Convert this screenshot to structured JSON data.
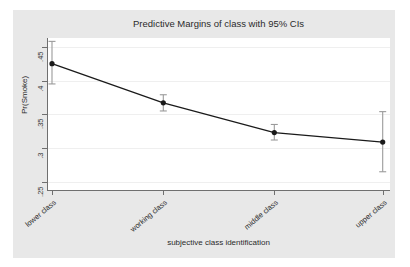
{
  "chart_data": {
    "type": "line",
    "title": "Predictive Margins of class with 95% CIs",
    "xlabel": "subjective class identification",
    "ylabel": "Pr(Smoke)",
    "categories": [
      "lower class",
      "working class",
      "middle class",
      "upper class"
    ],
    "values": [
      0.425,
      0.367,
      0.323,
      0.309
    ],
    "error_bars": {
      "lower": [
        0.395,
        0.355,
        0.312,
        0.265
      ],
      "upper": [
        0.458,
        0.379,
        0.335,
        0.354
      ]
    },
    "ylim": [
      0.238,
      0.463
    ],
    "yticks": [
      0.25,
      0.3,
      0.35,
      0.4,
      0.45
    ],
    "ytick_labels": [
      ".25",
      ".3",
      ".35",
      ".4",
      ".45"
    ],
    "grid": true,
    "legend": "none",
    "marker": "filled-circle",
    "line_color": "#1a1a1a",
    "marker_color": "#1a1a1a",
    "errorbar_color": "#9a9a9a",
    "plot_background": "#ffffff",
    "graph_background": "#e8e8e8"
  }
}
